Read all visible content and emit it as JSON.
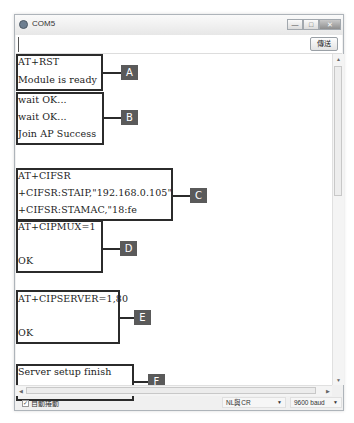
{
  "window": {
    "title": "COM5",
    "controls": {
      "minimize": "—",
      "maximize": "□",
      "close": "✕"
    }
  },
  "send_bar": {
    "input_value": "",
    "send_label": "傳送"
  },
  "output": {
    "lines": [
      "AT+RST",
      "Module is ready",
      "wait OK...",
      "wait OK...",
      "Join AP Success",
      "AT+CIFSR",
      "+CIFSR:STAIP,\"192.168.0.105\"",
      "+CIFSR:STAMAC,\"18:fe",
      "AT+CIPMUX=1",
      "OK",
      "AT+CIPSERVER=1,80",
      "OK",
      "Server setup finish",
      "connect WiFi Success"
    ]
  },
  "annotations": [
    {
      "label": "A"
    },
    {
      "label": "B"
    },
    {
      "label": "C"
    },
    {
      "label": "D"
    },
    {
      "label": "E"
    },
    {
      "label": "F"
    }
  ],
  "statusbar": {
    "autoscroll_label": "自動捲動",
    "autoscroll_checked": true,
    "line_ending": "NL與CR",
    "baud_rate": "9600 baud"
  },
  "scroll_glyphs": {
    "up": "▲",
    "down": "▼",
    "left": "◀",
    "right": "▶"
  }
}
